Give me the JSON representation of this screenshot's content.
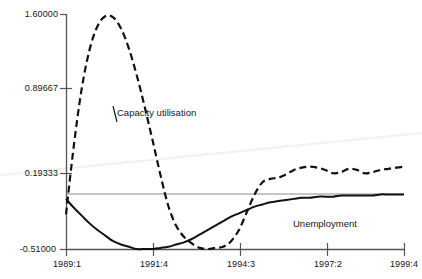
{
  "chart_data": {
    "type": "line",
    "title": "",
    "xlabel": "",
    "ylabel": "",
    "grid": false,
    "legend_position": "inline-annotations",
    "xlim": [
      "1989:1",
      "1999:4"
    ],
    "ylim": [
      -0.51,
      1.6
    ],
    "yticks": [
      "1.60000",
      "0.89667",
      "0.19333",
      "-0.51000"
    ],
    "ytick_values": [
      1.6,
      0.89667,
      0.19333,
      -0.51
    ],
    "xticks": [
      "1989:1",
      "1991:4",
      "1994:3",
      "1997:2",
      "1999:4"
    ],
    "xtick_values": [
      1989.0,
      1991.75,
      1994.5,
      1997.25,
      1999.75
    ],
    "reference_line": {
      "name": "zero-reference-line",
      "y": -0.03,
      "color": "#888888",
      "style": "solid"
    },
    "series": [
      {
        "name": "Capacity utilisation",
        "style": "dashed",
        "color": "#111111",
        "annotation_label": "Capacity utilisation",
        "x": [
          1989.0,
          1989.25,
          1989.5,
          1989.75,
          1990.0,
          1990.25,
          1990.5,
          1990.75,
          1991.0,
          1991.25,
          1991.5,
          1991.75,
          1992.0,
          1992.25,
          1992.5,
          1992.75,
          1993.0,
          1993.25,
          1993.5,
          1993.75,
          1994.0,
          1994.25,
          1994.5,
          1994.75,
          1995.0,
          1995.25,
          1995.5,
          1995.75,
          1996.0,
          1996.25,
          1996.5,
          1996.75,
          1997.0,
          1997.25,
          1997.5,
          1997.75,
          1998.0,
          1998.25,
          1998.5,
          1998.75,
          1999.0,
          1999.25,
          1999.5,
          1999.75
        ],
        "y": [
          -0.2,
          0.42,
          0.93,
          1.28,
          1.49,
          1.58,
          1.57,
          1.47,
          1.29,
          1.05,
          0.77,
          0.47,
          0.16,
          -0.12,
          -0.3,
          -0.4,
          -0.46,
          -0.5,
          -0.51,
          -0.5,
          -0.49,
          -0.44,
          -0.34,
          -0.18,
          -0.02,
          0.09,
          0.12,
          0.13,
          0.16,
          0.2,
          0.22,
          0.23,
          0.22,
          0.2,
          0.17,
          0.18,
          0.21,
          0.2,
          0.17,
          0.18,
          0.2,
          0.21,
          0.22,
          0.23
        ]
      },
      {
        "name": "Unemployment",
        "style": "solid",
        "color": "#111111",
        "annotation_label": "Unemployment",
        "x": [
          1989.0,
          1989.25,
          1989.5,
          1989.75,
          1990.0,
          1990.25,
          1990.5,
          1990.75,
          1991.0,
          1991.25,
          1991.5,
          1991.75,
          1992.0,
          1992.25,
          1992.5,
          1992.75,
          1993.0,
          1993.25,
          1993.5,
          1993.75,
          1994.0,
          1994.25,
          1994.5,
          1994.75,
          1995.0,
          1995.25,
          1995.5,
          1995.75,
          1996.0,
          1996.25,
          1996.5,
          1996.75,
          1997.0,
          1997.25,
          1997.5,
          1997.75,
          1998.0,
          1998.25,
          1998.5,
          1998.75,
          1999.0,
          1999.25,
          1999.5,
          1999.75
        ],
        "y": [
          -0.06,
          -0.14,
          -0.21,
          -0.28,
          -0.34,
          -0.39,
          -0.44,
          -0.47,
          -0.49,
          -0.51,
          -0.51,
          -0.51,
          -0.5,
          -0.49,
          -0.47,
          -0.45,
          -0.42,
          -0.38,
          -0.34,
          -0.3,
          -0.26,
          -0.22,
          -0.19,
          -0.16,
          -0.13,
          -0.11,
          -0.09,
          -0.08,
          -0.07,
          -0.06,
          -0.05,
          -0.05,
          -0.04,
          -0.04,
          -0.04,
          -0.03,
          -0.03,
          -0.03,
          -0.03,
          -0.03,
          -0.02,
          -0.02,
          -0.02,
          -0.02
        ]
      }
    ],
    "annotations": [
      {
        "name": "capacity-utilisation-annotation",
        "text": "Capacity utilisation"
      },
      {
        "name": "unemployment-annotation",
        "text": "Unemployment"
      }
    ]
  },
  "axes": {
    "y": {
      "ticks": [
        {
          "label": "1.60000"
        },
        {
          "label": "0.89667"
        },
        {
          "label": "0.19333"
        },
        {
          "label": "-0.51000"
        }
      ]
    },
    "x": {
      "ticks": [
        {
          "label": "1989:1"
        },
        {
          "label": "1991:4"
        },
        {
          "label": "1994:3"
        },
        {
          "label": "1997:2"
        },
        {
          "label": "1999:4"
        }
      ]
    }
  },
  "style": {
    "axis_color": "#6b6b6b",
    "series_color": "#111111",
    "reference_line_color": "#8c8c8c",
    "artifact_color": "#f0f0f0",
    "background": "#ffffff"
  }
}
